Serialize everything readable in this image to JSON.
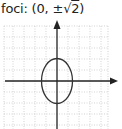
{
  "caption": {
    "prefix": "foci: (0, ",
    "pm": "±",
    "radical": "√",
    "radicand": "2",
    "suffix": ")"
  },
  "diagram": {
    "type": "ellipse-on-grid",
    "center": [
      0,
      0
    ],
    "semi_axis_x": 1.4,
    "semi_axis_y": 2,
    "major_axis": "vertical",
    "foci": "(0, ±√2)",
    "grid": {
      "style": "dotted",
      "color": "#c8c8c8",
      "spacing_px": 11
    },
    "axes": {
      "color": "#222222",
      "arrows": [
        "x+",
        "y+"
      ]
    },
    "curve_color": "#333333"
  }
}
